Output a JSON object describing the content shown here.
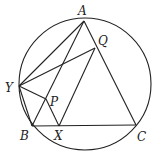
{
  "diagram": {
    "circle": {
      "cx": 85,
      "cy": 84,
      "r": 66
    },
    "points": {
      "A": {
        "label": "A",
        "x": 84,
        "y": 21,
        "lx": 78,
        "ly": 15
      },
      "Q": {
        "label": "Q",
        "x": 95,
        "y": 48,
        "lx": 98,
        "ly": 45
      },
      "Y": {
        "label": "Y",
        "x": 19,
        "y": 86,
        "lx": 5,
        "ly": 92
      },
      "P": {
        "label": "P",
        "x": 46,
        "y": 99,
        "lx": 50,
        "ly": 106
      },
      "B": {
        "label": "B",
        "x": 32,
        "y": 126,
        "lx": 20,
        "ly": 140
      },
      "X": {
        "label": "X",
        "x": 59,
        "y": 126,
        "lx": 54,
        "ly": 140
      },
      "C": {
        "label": "C",
        "x": 136,
        "y": 125,
        "lx": 137,
        "ly": 141
      }
    },
    "segments": [
      [
        "A",
        "B"
      ],
      [
        "A",
        "C"
      ],
      [
        "B",
        "C"
      ],
      [
        "Y",
        "A"
      ],
      [
        "Y",
        "Q"
      ],
      [
        "Y",
        "P"
      ],
      [
        "P",
        "X"
      ],
      [
        "X",
        "Q"
      ],
      [
        "Y",
        "B"
      ]
    ]
  }
}
